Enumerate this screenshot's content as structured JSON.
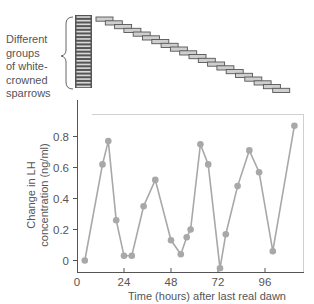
{
  "figure": {
    "group_label_lines": [
      "Different",
      "groups",
      "of white-",
      "crowned",
      "sparrows"
    ],
    "ylabel_lines": [
      "Change in LH",
      "concentration (ng/ml)"
    ],
    "xlabel": "Time (hours) after last real dawn"
  },
  "chart_data": {
    "type": "line",
    "title": "",
    "xlabel": "Time (hours) after last real dawn",
    "ylabel": "Change in LH concentration (ng/ml)",
    "x_ticks": [
      0,
      24,
      48,
      72,
      96
    ],
    "y_ticks": [
      0,
      0.2,
      0.4,
      0.6,
      0.8
    ],
    "y_tick_labels": [
      "0",
      "0.2",
      "0.4",
      "0.6",
      "0.8"
    ],
    "xlim": [
      0,
      116
    ],
    "ylim": [
      -0.08,
      0.93
    ],
    "grid": false,
    "legend": null,
    "series": [
      {
        "name": "LH concentration change",
        "color": "#a8a8a8",
        "x": [
          4,
          13,
          16,
          20,
          24,
          28,
          34,
          40,
          48,
          53,
          56,
          58,
          63,
          67,
          73,
          76,
          82,
          88,
          93,
          100,
          111
        ],
        "y": [
          0.0,
          0.62,
          0.77,
          0.26,
          0.03,
          0.03,
          0.35,
          0.52,
          0.13,
          0.04,
          0.15,
          0.2,
          0.75,
          0.62,
          -0.05,
          0.17,
          0.48,
          0.71,
          0.57,
          0.06,
          0.87
        ]
      }
    ],
    "annotation": {
      "type": "group_bars",
      "label": "Different groups of white-crowned sparrows",
      "stacked_groups": 20,
      "staggered_groups": 20
    }
  }
}
